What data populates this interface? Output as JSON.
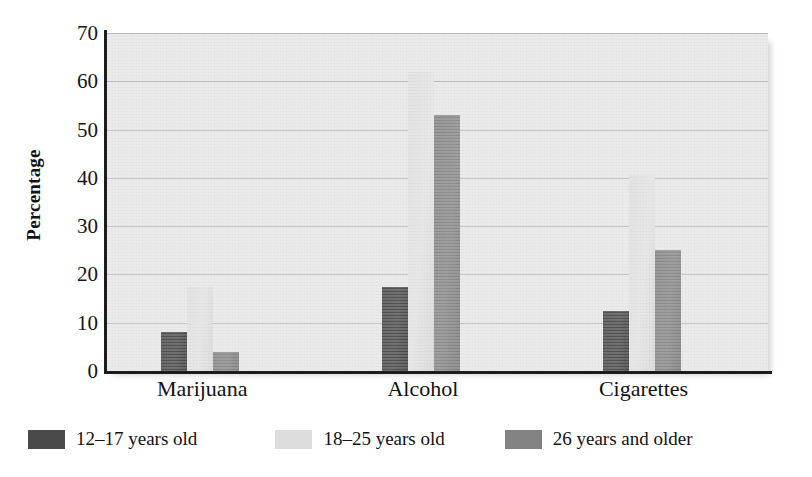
{
  "chart_data": {
    "type": "bar",
    "title": "",
    "subtitle": "",
    "xlabel": "",
    "ylabel": "Percentage",
    "ylim": [
      0,
      70
    ],
    "ytick_step": 10,
    "yticks": [
      "70",
      "60",
      "50",
      "40",
      "30",
      "20",
      "10",
      "0"
    ],
    "grid": true,
    "legend_position": "bottom-left",
    "categories": [
      "Marijuana",
      "Alcohol",
      "Cigarettes"
    ],
    "series": [
      {
        "name": "12–17 years old",
        "color": "#4a4a4a",
        "values": [
          8,
          17.5,
          12.5
        ]
      },
      {
        "name": "18–25 years old",
        "color": "#dcdcdc",
        "values": [
          17.5,
          62,
          40.5
        ]
      },
      {
        "name": "26 years and older",
        "color": "#828282",
        "values": [
          4,
          53,
          25
        ]
      }
    ]
  },
  "legend": {
    "items": [
      {
        "label": "12–17 years old",
        "swatch": "legend-swatch-dark"
      },
      {
        "label": "18–25 years old",
        "swatch": "legend-swatch-light"
      },
      {
        "label": "26 years and older",
        "swatch": "legend-swatch-medium"
      }
    ]
  },
  "axes": {
    "y_title": "Percentage"
  }
}
